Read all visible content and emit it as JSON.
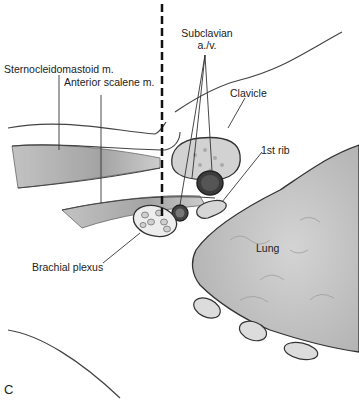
{
  "figure": {
    "panel_label": "C",
    "labels": {
      "sternocleidomastoid": "Sternocleidomastoid m.",
      "anterior_scalene": "Anterior scalene m.",
      "subclavian_line1": "Subclavian",
      "subclavian_line2": "a./v.",
      "clavicle": "Clavicle",
      "first_rib": "1st rib",
      "lung": "Lung",
      "brachial_plexus": "Brachial plexus"
    }
  },
  "colors": {
    "outline": "#333333",
    "muscle": "#a8a8a8",
    "lung_fill": "#c9c9c9",
    "bone_fill": "#d6d6d6",
    "vessel_dark": "#3a3a3a",
    "dashed_line": "#111111"
  }
}
